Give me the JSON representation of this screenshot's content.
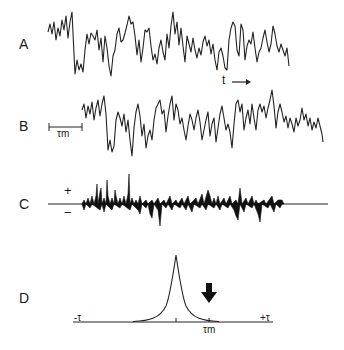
{
  "panels": {
    "A": {
      "label": "A",
      "description": "raw signal trace"
    },
    "B": {
      "label": "B",
      "description": "signal trace shifted by tau_m",
      "scale_bar_label": "τm"
    },
    "C": {
      "label": "C",
      "description": "product trace",
      "plus_label": "+",
      "minus_label": "−"
    },
    "D": {
      "label": "D",
      "description": "cross-correlation function",
      "left_axis_label": "-τ",
      "right_axis_label": "+τ",
      "tick_label": "τm"
    }
  },
  "annotations": {
    "time_arrow": "t"
  },
  "colors": {
    "ink": "#222222",
    "background": "#ffffff"
  }
}
